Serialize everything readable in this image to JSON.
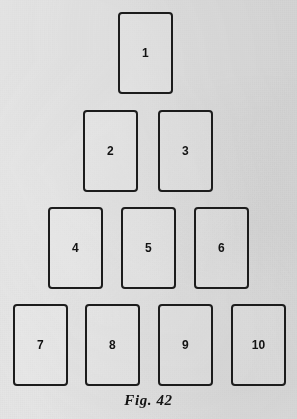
{
  "figure": {
    "caption": "Fig. 42",
    "background_color": "#e5e5e5",
    "ink_color": "#1c1c1c",
    "layout": "pyramid",
    "total_cards": 10,
    "rows": [
      {
        "row": 1,
        "count": 1
      },
      {
        "row": 2,
        "count": 2
      },
      {
        "row": 3,
        "count": 3
      },
      {
        "row": 4,
        "count": 4
      }
    ],
    "cards": [
      {
        "label": "1",
        "row": 1,
        "x": 118,
        "y": 12,
        "w": 55,
        "h": 82
      },
      {
        "label": "2",
        "row": 2,
        "x": 83,
        "y": 110,
        "w": 55,
        "h": 82
      },
      {
        "label": "3",
        "row": 2,
        "x": 158,
        "y": 110,
        "w": 55,
        "h": 82
      },
      {
        "label": "4",
        "row": 3,
        "x": 48,
        "y": 207,
        "w": 55,
        "h": 82
      },
      {
        "label": "5",
        "row": 3,
        "x": 121,
        "y": 207,
        "w": 55,
        "h": 82
      },
      {
        "label": "6",
        "row": 3,
        "x": 194,
        "y": 207,
        "w": 55,
        "h": 82
      },
      {
        "label": "7",
        "row": 4,
        "x": 13,
        "y": 304,
        "w": 55,
        "h": 82
      },
      {
        "label": "8",
        "row": 4,
        "x": 85,
        "y": 304,
        "w": 55,
        "h": 82
      },
      {
        "label": "9",
        "row": 4,
        "x": 158,
        "y": 304,
        "w": 55,
        "h": 82
      },
      {
        "label": "10",
        "row": 4,
        "x": 231,
        "y": 304,
        "w": 55,
        "h": 82
      }
    ]
  }
}
